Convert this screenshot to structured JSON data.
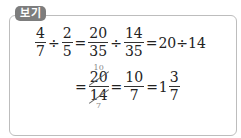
{
  "label": "보기",
  "line1": {
    "f1": {
      "num": "4",
      "den": "7"
    },
    "op1": "÷",
    "f2": {
      "num": "2",
      "den": "5"
    },
    "eq1": "=",
    "f3": {
      "num": "20",
      "den": "35"
    },
    "op2": "÷",
    "f4": {
      "num": "14",
      "den": "35"
    },
    "eq2": "=",
    "tail": "20÷14"
  },
  "line2": {
    "eq1": "=",
    "f1": {
      "num": "20",
      "den": "14",
      "num_reduced": "10",
      "den_reduced": "7"
    },
    "eq2": "=",
    "f2": {
      "num": "10",
      "den": "7"
    },
    "eq3": "=",
    "mixed": {
      "whole": "1",
      "num": "3",
      "den": "7"
    }
  }
}
